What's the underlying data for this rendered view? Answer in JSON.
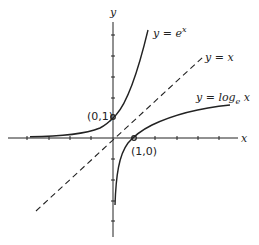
{
  "diagram": {
    "axes": {
      "x_label": "x",
      "y_label": "y"
    },
    "curves": [
      {
        "name": "exp",
        "label_lhs": "y = e",
        "label_sup": "x"
      },
      {
        "name": "identity",
        "label": "y = x",
        "style": "dashed"
      },
      {
        "name": "log",
        "label_lhs": "y = log",
        "label_sub": "e",
        "label_rhs": " x"
      }
    ],
    "points": [
      {
        "label": "(0,1)",
        "x": 0,
        "y": 1
      },
      {
        "label": "(1,0)",
        "x": 1,
        "y": 0
      }
    ],
    "colors": {
      "ink": "#222222",
      "background": "#ffffff"
    }
  }
}
